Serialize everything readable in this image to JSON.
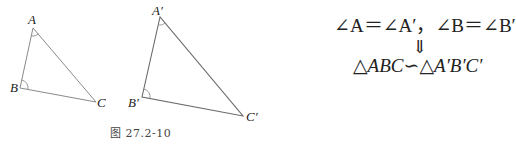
{
  "figure": {
    "caption": "图 27.2-10",
    "triangle_1": {
      "vertices": {
        "A": [
          33,
          28
        ],
        "B": [
          20,
          88
        ],
        "C": [
          96,
          102
        ]
      },
      "labels": {
        "A": "A",
        "B": "B",
        "C": "C"
      },
      "marked_angles": [
        "A",
        "B"
      ],
      "stroke": "#8a8a8a"
    },
    "triangle_2": {
      "vertices": {
        "A": [
          160,
          17
        ],
        "B": [
          142,
          97
        ],
        "C": [
          243,
          116
        ]
      },
      "labels": {
        "A": "A′",
        "B": "B′",
        "C": "C′"
      },
      "marked_angles": [
        "A",
        "B"
      ],
      "stroke": "#6a6a6a"
    }
  },
  "formula": {
    "condition": "∠A＝∠A′，∠B＝∠B′",
    "implies": "⇓",
    "conclusion": "△ABC∽△A′B′C′"
  }
}
